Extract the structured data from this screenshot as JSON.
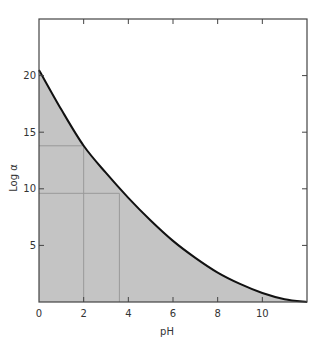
{
  "chart_data": {
    "type": "area",
    "title": "",
    "xlabel": "pH",
    "ylabel": "Log α",
    "xlim": [
      0,
      12
    ],
    "ylim": [
      0,
      25
    ],
    "x_ticks": [
      0,
      2,
      4,
      6,
      8,
      10
    ],
    "y_ticks": [
      5,
      10,
      15,
      20
    ],
    "x_tick_labels": [
      "0",
      "2",
      "4",
      "6",
      "8",
      "10"
    ],
    "y_tick_labels": [
      "5",
      "10",
      "15",
      "20"
    ],
    "grid": false,
    "legend": null,
    "series": [
      {
        "name": "Log α vs pH",
        "fill": "#c4c4c4",
        "line_color": "#111111",
        "x": [
          0,
          1,
          2,
          3,
          4,
          5,
          6,
          7,
          8,
          9,
          10,
          11,
          12
        ],
        "values": [
          20.5,
          17.0,
          13.8,
          11.4,
          9.2,
          7.2,
          5.4,
          3.9,
          2.6,
          1.6,
          0.8,
          0.25,
          0.0
        ]
      }
    ],
    "annotations": {
      "reference_lines": [
        {
          "orientation": "horizontal",
          "y": 13.8,
          "x_to": 2.0
        },
        {
          "orientation": "horizontal",
          "y": 9.6,
          "x_to": 3.6
        },
        {
          "orientation": "vertical",
          "x": 2.0,
          "y_to": 13.8
        },
        {
          "orientation": "vertical",
          "x": 3.6,
          "y_to": 9.6
        }
      ]
    }
  }
}
